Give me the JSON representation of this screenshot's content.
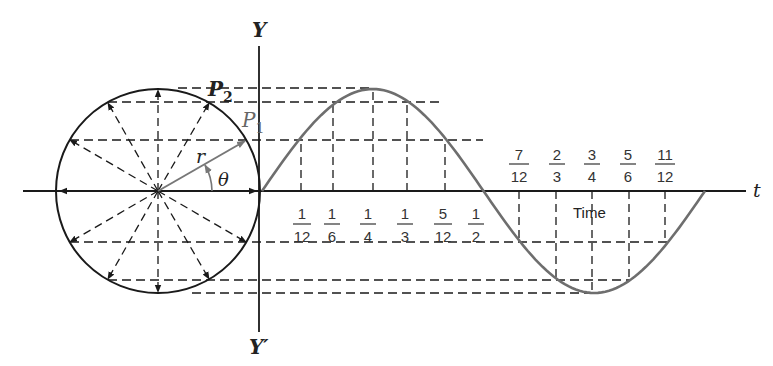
{
  "diagram": {
    "labels": {
      "y_axis_top": "Y",
      "y_axis_bottom": "Y′",
      "t_axis": "t",
      "p1": "P",
      "p1_sub": "1",
      "p2": "P",
      "p2_sub": "2",
      "radius": "r",
      "angle": "θ",
      "time": "Time"
    },
    "fractions_above": [
      {
        "num": "7",
        "den": "12"
      },
      {
        "num": "2",
        "den": "3"
      },
      {
        "num": "3",
        "den": "4"
      },
      {
        "num": "5",
        "den": "6"
      },
      {
        "num": "11",
        "den": "12"
      }
    ],
    "fractions_below": [
      {
        "num": "1",
        "den": "12"
      },
      {
        "num": "1",
        "den": "6"
      },
      {
        "num": "1",
        "den": "4"
      },
      {
        "num": "1",
        "den": "3"
      },
      {
        "num": "5",
        "den": "12"
      },
      {
        "num": "1",
        "den": "2"
      }
    ],
    "colors": {
      "ink": "#1a1a1a",
      "curve": "#6e6e6e",
      "radius_vector": "#777777"
    }
  }
}
